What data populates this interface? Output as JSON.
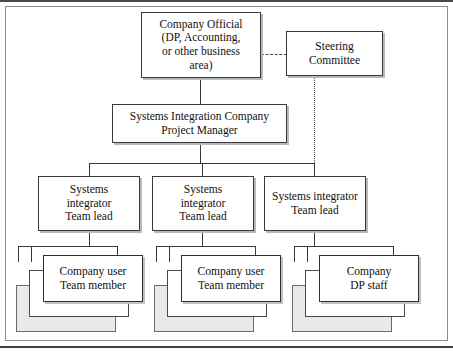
{
  "figure": {
    "type": "organization-chart"
  },
  "nodes": {
    "company_official": {
      "label": "Company Official\n(DP, Accounting,\nor other business\narea)",
      "lines": [
        "Company Official",
        "(DP, Accounting,",
        "or other business",
        "area)"
      ]
    },
    "steering_committee": {
      "label": "Steering\nCommittee",
      "lines": [
        "Steering",
        "Committee"
      ]
    },
    "project_manager": {
      "label": "Systems Integration Company\nProject Manager",
      "lines": [
        "Systems Integration Company",
        "Project Manager"
      ]
    },
    "team_lead_1": {
      "label": "Systems\nintegrator\nTeam lead",
      "lines": [
        "Systems",
        "integrator",
        "Team lead"
      ]
    },
    "team_lead_2": {
      "label": "Systems\nintegrator\nTeam lead",
      "lines": [
        "Systems",
        "integrator",
        "Team lead"
      ]
    },
    "team_lead_3": {
      "label": "Systems integrator\nTeam lead",
      "lines": [
        "Systems integrator",
        "Team lead"
      ]
    },
    "members_1": {
      "label": "Company user\nTeam member",
      "lines": [
        "Company user",
        "Team member"
      ],
      "stacked_count": 3
    },
    "members_2": {
      "label": "Company user\nTeam member",
      "lines": [
        "Company user",
        "Team member"
      ],
      "stacked_count": 3
    },
    "members_3": {
      "label": "Company\nDP staff",
      "lines": [
        "Company",
        "DP staff"
      ],
      "stacked_count": 3
    }
  },
  "connectors": [
    {
      "name": "official-to-steering",
      "style": "dashed",
      "orientation": "horizontal"
    },
    {
      "name": "official-to-project-manager",
      "style": "solid",
      "orientation": "vertical"
    },
    {
      "name": "project-manager-to-bus",
      "style": "solid",
      "orientation": "vertical"
    },
    {
      "name": "team-lead-bus",
      "style": "solid",
      "orientation": "horizontal"
    },
    {
      "name": "steering-to-bus",
      "style": "dotted",
      "orientation": "vertical"
    },
    {
      "name": "team-lead-to-members",
      "style": "solid",
      "orientation": "vertical"
    }
  ],
  "colors": {
    "line": "#3a3a3a",
    "frame": "#8d8d8d",
    "rule": "#4a4a4a",
    "box_fill": "#ffffff",
    "stack_back_fill": "#e9e9e9",
    "shadow": "#b9b9b9",
    "text": "#111111"
  }
}
